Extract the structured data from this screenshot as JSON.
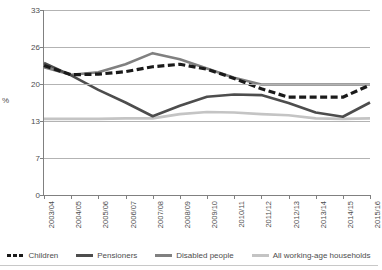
{
  "axis": {
    "y_label": "%",
    "y_ticks": [
      "33",
      "26",
      "20",
      "13",
      "7",
      "0"
    ],
    "x_ticks": [
      "2003/04",
      "2004/05",
      "2005/06",
      "2006/07",
      "2007/08",
      "2008/09",
      "2009/10",
      "2010/11",
      "2011/12",
      "2012/13",
      "2013/14",
      "2014/15",
      "2015/16"
    ]
  },
  "legend": {
    "items": [
      {
        "label": "Children",
        "color": "#1a1a1a",
        "style": "dashed"
      },
      {
        "label": "Pensioners",
        "color": "#4d4d4d",
        "style": "solid"
      },
      {
        "label": "Disabled people",
        "color": "#808080",
        "style": "solid"
      },
      {
        "label": "All working-age households",
        "color": "#c4c4c4",
        "style": "solid"
      }
    ]
  },
  "colors": {
    "children": "#1a1a1a",
    "pensioners": "#4d4d4d",
    "disabled": "#808080",
    "working_age": "#c4c4c4",
    "grid": "#b3b3b3",
    "axis": "#808080",
    "text": "#4d4d4d",
    "background": "#ffffff"
  },
  "chart_data": {
    "type": "line",
    "title": "",
    "xlabel": "",
    "ylabel": "%",
    "ylim": [
      0,
      33
    ],
    "y_tick_values": [
      0,
      7,
      13,
      20,
      26,
      33
    ],
    "grid": true,
    "legend_position": "bottom",
    "categories": [
      "2003/04",
      "2004/05",
      "2005/06",
      "2006/07",
      "2007/08",
      "2008/09",
      "2009/10",
      "2010/11",
      "2011/12",
      "2012/13",
      "2013/14",
      "2014/15",
      "2015/16"
    ],
    "series": [
      {
        "name": "Children",
        "color": "#1a1a1a",
        "style": "dashed",
        "values": [
          23.0,
          21.5,
          21.6,
          22.0,
          22.8,
          23.2,
          22.4,
          20.9,
          19.1,
          17.5,
          17.5,
          17.5,
          19.8
        ]
      },
      {
        "name": "Pensioners",
        "color": "#4d4d4d",
        "style": "solid",
        "values": [
          23.4,
          21.4,
          18.9,
          16.5,
          13.9,
          15.9,
          17.6,
          18.0,
          17.9,
          16.4,
          14.6,
          13.8,
          16.5
        ]
      },
      {
        "name": "Disabled people",
        "color": "#808080",
        "style": "solid",
        "values": [
          22.7,
          21.5,
          21.9,
          23.2,
          25.0,
          24.0,
          22.5,
          21.0,
          19.9,
          19.9,
          19.9,
          19.9,
          19.9
        ]
      },
      {
        "name": "All working-age households",
        "color": "#c4c4c4",
        "style": "solid",
        "values": [
          13.4,
          13.4,
          13.4,
          13.5,
          13.5,
          14.3,
          14.7,
          14.6,
          14.3,
          14.1,
          13.5,
          13.4,
          13.5
        ]
      }
    ]
  }
}
